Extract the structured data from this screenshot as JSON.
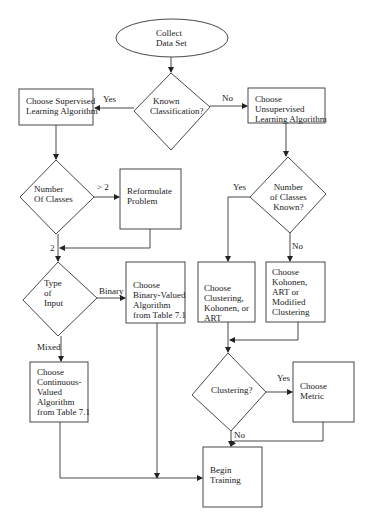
{
  "diagram": {
    "type": "flowchart",
    "nodes": {
      "start": {
        "shape": "ellipse",
        "lines": [
          "Collect",
          "Data Set"
        ]
      },
      "known_classification": {
        "shape": "diamond",
        "lines": [
          "Known",
          "Classification?"
        ]
      },
      "supervised": {
        "shape": "box",
        "lines": [
          "Choose Supervised",
          "Learning Algorithm"
        ]
      },
      "unsupervised": {
        "shape": "box",
        "lines": [
          "Choose",
          "Unsupervised",
          "Learning Algorithm"
        ]
      },
      "number_of_classes": {
        "shape": "diamond",
        "lines": [
          "Number",
          "Of Classes"
        ]
      },
      "reformulate": {
        "shape": "box",
        "lines": [
          "Reformulate",
          "Problem"
        ]
      },
      "type_of_input": {
        "shape": "diamond",
        "lines": [
          "Type",
          "of",
          "Input"
        ]
      },
      "binary_valued": {
        "shape": "box",
        "lines": [
          "Choose",
          "Binary-Valued",
          "Algorithm",
          "from Table 7.1"
        ]
      },
      "continuous_valued": {
        "shape": "box",
        "lines": [
          "Choose",
          "Continuous-",
          "Valued",
          "Algorithm",
          "from Table 7.1"
        ]
      },
      "classes_known": {
        "shape": "diamond",
        "lines": [
          "Number",
          "of Classes",
          "Known?"
        ]
      },
      "clustering_kohonen_art": {
        "shape": "box",
        "lines": [
          "Choose",
          "Clustering,",
          "Kohonen, or",
          "ART"
        ]
      },
      "kohonen_art_modified": {
        "shape": "box",
        "lines": [
          "Choose",
          "Kohonen,",
          "ART or",
          "Modified",
          "Clustering"
        ]
      },
      "clustering_q": {
        "shape": "diamond",
        "lines": [
          "Clustering?"
        ]
      },
      "choose_metric": {
        "shape": "box",
        "lines": [
          "Choose",
          "Metric"
        ]
      },
      "begin_training": {
        "shape": "box",
        "lines": [
          "Begin",
          "Training"
        ]
      }
    },
    "edge_labels": {
      "yes_supervised": "Yes",
      "no_unsupervised": "No",
      "gt2": "> 2",
      "eq2": "2",
      "binary": "Binary",
      "mixed": "Mixed",
      "yes_known": "Yes",
      "no_known": "No",
      "yes_clustering": "Yes",
      "no_clustering": "No"
    }
  }
}
